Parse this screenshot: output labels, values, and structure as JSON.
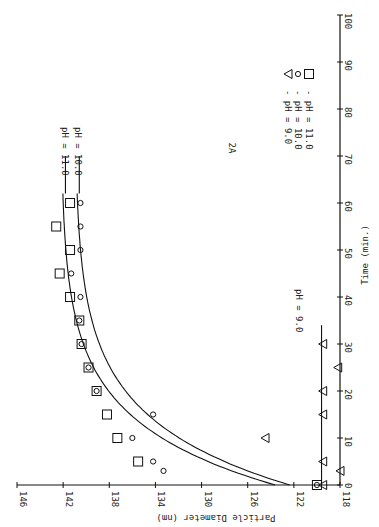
{
  "chart_data": {
    "type": "scatter",
    "title": "2A",
    "orientation": "rotated 90° clockwise",
    "xlabel": "Time (min.)",
    "ylabel": "Particle Diameter (nm)",
    "xlim": [
      0,
      100
    ],
    "ylim": [
      118,
      146
    ],
    "x_ticks": [
      0,
      10,
      20,
      30,
      40,
      50,
      60,
      70,
      80,
      90,
      100
    ],
    "y_ticks": [
      118,
      122,
      126,
      130,
      134,
      138,
      142,
      146
    ],
    "grid": false,
    "legend": [
      {
        "marker": "triangle",
        "label": "- pH = 9.0"
      },
      {
        "marker": "circle",
        "label": "- pH = 10.0"
      },
      {
        "marker": "square",
        "label": "- pH = 11.0"
      }
    ],
    "series": [
      {
        "name": "pH = 11.0",
        "marker": "square",
        "x": [
          0,
          5,
          10,
          15,
          20,
          25,
          30,
          35,
          40,
          45,
          50,
          55,
          60
        ],
        "y": [
          120,
          135.5,
          137.3,
          138.2,
          139.1,
          139.8,
          140.4,
          140.6,
          141.4,
          142.3,
          141.4,
          142.6,
          141.4
        ],
        "curve_label": "pH = 11.0"
      },
      {
        "name": "pH = 10.0",
        "marker": "circle",
        "x": [
          0,
          3,
          5,
          10,
          15,
          20,
          25,
          30,
          35,
          40,
          45,
          50,
          55,
          60
        ],
        "y": [
          120,
          133.3,
          134.2,
          136.0,
          134.2,
          139.1,
          139.8,
          140.4,
          140.6,
          140.5,
          141.3,
          140.5,
          140.5,
          140.5
        ],
        "curve_label": "pH = 10.0"
      },
      {
        "name": "pH = 9.0",
        "marker": "triangle",
        "x": [
          0,
          3,
          5,
          10,
          15,
          20,
          25,
          30
        ],
        "y": [
          119.5,
          118,
          119.5,
          124.5,
          119.5,
          119.5,
          118.2,
          119.5
        ],
        "curve_label": "pH = 9.0"
      }
    ]
  },
  "labels": {
    "panel": "2A",
    "xlabel": "Time (min.)",
    "ylabel": "Particle Diameter (nm)",
    "legend_ph9": "- pH = 9.0",
    "legend_ph10": "- pH = 10.0",
    "legend_ph11": "- pH = 11.0",
    "curve_ph11": "pH = 11.0",
    "curve_ph10": "pH = 10.0",
    "curve_ph9": "pH = 9.0"
  }
}
